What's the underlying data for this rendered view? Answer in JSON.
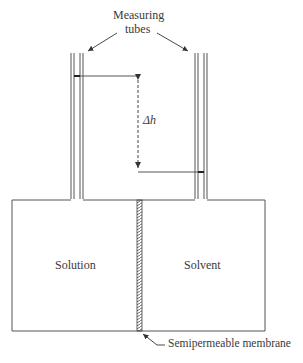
{
  "diagram": {
    "title_labels": {
      "measuring_line1": "Measuring",
      "measuring_line2": "tubes"
    },
    "delta_h": "Δh",
    "left_chamber": "Solution",
    "right_chamber": "Solvent",
    "membrane_label": "Semipermeable membrane",
    "colors": {
      "line": "#555555",
      "background": "#ffffff"
    }
  }
}
